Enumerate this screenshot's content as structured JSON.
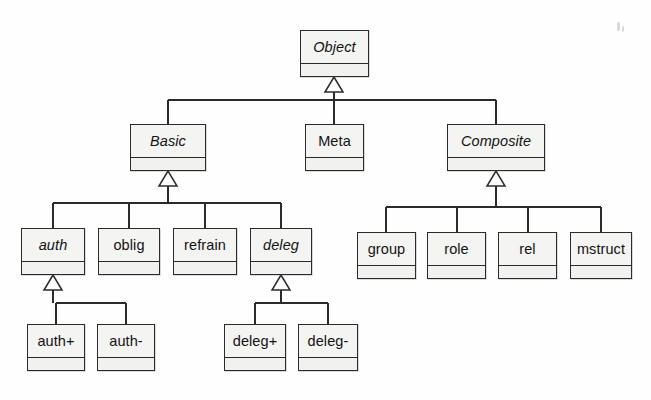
{
  "diagram": {
    "notation": "UML class diagram, generalization (hollow triangle) relationships",
    "style": {
      "box_fill": "#f2f2f0",
      "box_stroke": "#2b2b2b",
      "line_color": "#2b2b2b",
      "background": "#fefefe",
      "text_color": "#121212"
    },
    "classes": [
      {
        "id": "object",
        "label": "Object",
        "abstract": true,
        "x": 300,
        "y": 30,
        "w": 69,
        "h": 47,
        "name_h": 32
      },
      {
        "id": "basic",
        "label": "Basic",
        "abstract": true,
        "x": 130,
        "y": 124,
        "w": 76,
        "h": 47,
        "name_h": 32
      },
      {
        "id": "meta",
        "label": "Meta",
        "abstract": false,
        "x": 305,
        "y": 124,
        "w": 59,
        "h": 47,
        "name_h": 32
      },
      {
        "id": "composite",
        "label": "Composite",
        "abstract": true,
        "x": 447,
        "y": 124,
        "w": 98,
        "h": 47,
        "name_h": 32
      },
      {
        "id": "auth",
        "label": "auth",
        "abstract": true,
        "x": 21,
        "y": 228,
        "w": 64,
        "h": 47,
        "name_h": 32
      },
      {
        "id": "oblig",
        "label": "oblig",
        "abstract": false,
        "x": 98,
        "y": 228,
        "w": 62,
        "h": 47,
        "name_h": 32
      },
      {
        "id": "refrain",
        "label": "refrain",
        "abstract": false,
        "x": 173,
        "y": 228,
        "w": 64,
        "h": 47,
        "name_h": 32
      },
      {
        "id": "deleg",
        "label": "deleg",
        "abstract": true,
        "x": 250,
        "y": 228,
        "w": 62,
        "h": 47,
        "name_h": 32
      },
      {
        "id": "group",
        "label": "group",
        "abstract": false,
        "x": 357,
        "y": 232,
        "w": 59,
        "h": 47,
        "name_h": 32
      },
      {
        "id": "role",
        "label": "role",
        "abstract": false,
        "x": 427,
        "y": 232,
        "w": 59,
        "h": 47,
        "name_h": 32
      },
      {
        "id": "rel",
        "label": "rel",
        "abstract": false,
        "x": 498,
        "y": 232,
        "w": 59,
        "h": 47,
        "name_h": 32
      },
      {
        "id": "mstruct",
        "label": "mstruct",
        "abstract": false,
        "x": 570,
        "y": 232,
        "w": 62,
        "h": 47,
        "name_h": 32
      },
      {
        "id": "authplus",
        "label": "auth+",
        "abstract": false,
        "x": 27,
        "y": 324,
        "w": 58,
        "h": 47,
        "name_h": 32
      },
      {
        "id": "authminus",
        "label": "auth-",
        "abstract": false,
        "x": 97,
        "y": 324,
        "w": 58,
        "h": 47,
        "name_h": 32
      },
      {
        "id": "delegplus",
        "label": "deleg+",
        "abstract": false,
        "x": 224,
        "y": 324,
        "w": 62,
        "h": 47,
        "name_h": 32
      },
      {
        "id": "delegminus",
        "label": "deleg-",
        "abstract": false,
        "x": 298,
        "y": 324,
        "w": 60,
        "h": 47,
        "name_h": 32
      }
    ],
    "generalizations": [
      {
        "parent": "object",
        "children": [
          "basic",
          "meta",
          "composite"
        ]
      },
      {
        "parent": "basic",
        "children": [
          "auth",
          "oblig",
          "refrain",
          "deleg"
        ]
      },
      {
        "parent": "composite",
        "children": [
          "group",
          "role",
          "rel",
          "mstruct"
        ]
      },
      {
        "parent": "auth",
        "children": [
          "authplus",
          "authminus"
        ]
      },
      {
        "parent": "deleg",
        "children": [
          "delegplus",
          "delegminus"
        ]
      }
    ],
    "edge_geometry": [
      {
        "parent": "object",
        "stem_x": 334,
        "tri_top": 77,
        "bus_y": 100,
        "bus_x1": 168,
        "bus_x2": 496,
        "child_tops": [
          124,
          124,
          124
        ],
        "child_stems": [
          168,
          334,
          496
        ]
      },
      {
        "parent": "basic",
        "stem_x": 168,
        "tri_top": 171,
        "bus_y": 203,
        "bus_x1": 53,
        "bus_x2": 281,
        "child_tops": [
          228,
          228,
          228,
          228
        ],
        "child_stems": [
          53,
          129,
          205,
          281
        ]
      },
      {
        "parent": "composite",
        "stem_x": 496,
        "tri_top": 171,
        "bus_y": 207,
        "bus_x1": 386,
        "bus_x2": 601,
        "child_tops": [
          232,
          232,
          232,
          232
        ],
        "child_stems": [
          386,
          457,
          528,
          601
        ]
      },
      {
        "parent": "auth",
        "stem_x": 53,
        "tri_top": 275,
        "bus_y": 303,
        "bus_x1": 56,
        "bus_x2": 126,
        "child_tops": [
          324,
          324
        ],
        "child_stems": [
          56,
          126
        ]
      },
      {
        "parent": "deleg",
        "stem_x": 281,
        "tri_top": 275,
        "bus_y": 303,
        "bus_x1": 255,
        "bus_x2": 328,
        "child_tops": [
          324,
          324
        ],
        "child_stems": [
          255,
          328
        ]
      }
    ],
    "triangle": {
      "half_width": 9,
      "height": 15
    }
  }
}
